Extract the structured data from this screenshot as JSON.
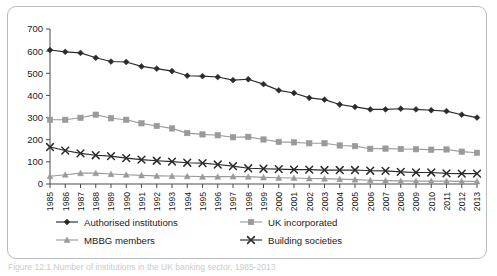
{
  "figure": {
    "caption": "Figure 12.1  Number of institutions in the UK banking sector, 1985-2013"
  },
  "colors": {
    "series_dark": "#2b2b2b",
    "series_gray": "#9a9a9a",
    "axis": "#4a4a4a",
    "border": "#b9bcbe",
    "background": "#ffffff"
  },
  "chart_data": {
    "type": "line",
    "title": "",
    "xlabel": "",
    "ylabel": "",
    "ylim": [
      0,
      700
    ],
    "ytick_step": 100,
    "grid": false,
    "legend_position": "bottom",
    "yticks": [
      "0",
      "100",
      "200",
      "300",
      "400",
      "500",
      "600",
      "700"
    ],
    "categories": [
      "1985",
      "1986",
      "1987",
      "1988",
      "1989",
      "1990",
      "1991",
      "1992",
      "1993",
      "1994",
      "1995",
      "1996",
      "1997",
      "1998",
      "1999",
      "2000",
      "2001",
      "2002",
      "2003",
      "2004",
      "2005",
      "2006",
      "2007",
      "2008",
      "2009",
      "2010",
      "2011",
      "2012",
      "2013"
    ],
    "series": [
      {
        "name": "Authorised institutions",
        "marker": "diamond",
        "color": "#2b2b2b",
        "values": [
          605,
          597,
          592,
          570,
          553,
          551,
          531,
          521,
          510,
          489,
          487,
          483,
          469,
          473,
          451,
          423,
          411,
          389,
          381,
          359,
          348,
          337,
          337,
          340,
          337,
          333,
          329,
          313,
          300
        ]
      },
      {
        "name": "UK incorporated",
        "marker": "square",
        "color": "#9a9a9a",
        "values": [
          290,
          290,
          299,
          313,
          297,
          290,
          274,
          262,
          251,
          230,
          224,
          220,
          211,
          213,
          201,
          190,
          188,
          184,
          184,
          174,
          171,
          159,
          160,
          158,
          157,
          155,
          156,
          146,
          141
        ]
      },
      {
        "name": "MBBG members",
        "marker": "triangle",
        "color": "#9a9a9a",
        "values": [
          35,
          42,
          49,
          49,
          45,
          42,
          39,
          37,
          36,
          35,
          33,
          33,
          34,
          33,
          30,
          28,
          27,
          25,
          24,
          22,
          20,
          17,
          15,
          14,
          13,
          13,
          13,
          12,
          12
        ]
      },
      {
        "name": "Building societies",
        "marker": "cross",
        "color": "#2b2b2b",
        "values": [
          167,
          151,
          138,
          130,
          126,
          117,
          110,
          105,
          101,
          96,
          94,
          88,
          81,
          71,
          69,
          67,
          65,
          65,
          63,
          63,
          63,
          60,
          59,
          55,
          52,
          52,
          48,
          47,
          47
        ]
      }
    ]
  },
  "legend": {
    "items": [
      {
        "label": "Authorised institutions",
        "marker": "diamond",
        "color": "#2b2b2b"
      },
      {
        "label": "UK incorporated",
        "marker": "square",
        "color": "#9a9a9a"
      },
      {
        "label": "MBBG members",
        "marker": "triangle",
        "color": "#9a9a9a"
      },
      {
        "label": "Building societies",
        "marker": "cross",
        "color": "#2b2b2b"
      }
    ]
  }
}
